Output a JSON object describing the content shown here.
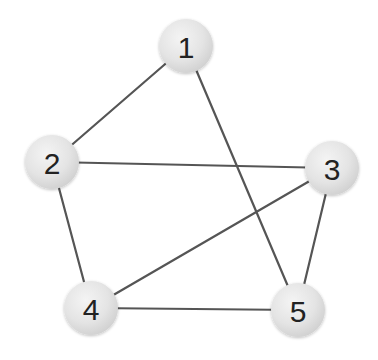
{
  "diagram": {
    "type": "undirected-graph",
    "colors": {
      "edge": "#555555",
      "node_fill_light": "#f2f2f2",
      "node_fill_dark": "#d4d4d4",
      "label": "#222222",
      "background": "#ffffff"
    },
    "node_radius": 27,
    "nodes": [
      {
        "id": "1",
        "label": "1",
        "x": 186,
        "y": 46
      },
      {
        "id": "2",
        "label": "2",
        "x": 52,
        "y": 162
      },
      {
        "id": "3",
        "label": "3",
        "x": 332,
        "y": 168
      },
      {
        "id": "4",
        "label": "4",
        "x": 91,
        "y": 308
      },
      {
        "id": "5",
        "label": "5",
        "x": 298,
        "y": 310
      }
    ],
    "edges": [
      {
        "from": "1",
        "to": "2"
      },
      {
        "from": "1",
        "to": "5"
      },
      {
        "from": "2",
        "to": "3"
      },
      {
        "from": "2",
        "to": "4"
      },
      {
        "from": "3",
        "to": "4"
      },
      {
        "from": "3",
        "to": "5"
      },
      {
        "from": "4",
        "to": "5"
      }
    ]
  }
}
